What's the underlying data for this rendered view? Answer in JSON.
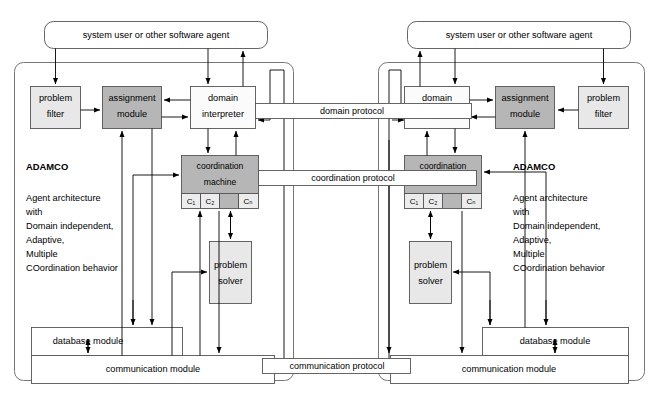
{
  "diagram": {
    "colors": {
      "white": "#ffffff",
      "light_gray": "#e8e8e8",
      "mid_gray": "#d9d9d9",
      "dark_gray": "#b6b6b6",
      "line": "#000000",
      "box_border": "#555555",
      "outer_border": "#777777"
    },
    "external_actors": [
      {
        "id": "actor-left",
        "label": "system user or other software agent"
      },
      {
        "id": "actor-right",
        "label": "system user or other software agent"
      }
    ],
    "protocols": [
      {
        "id": "domain-protocol",
        "label": "domain protocol"
      },
      {
        "id": "coordination-protocol",
        "label": "coordination protocol"
      },
      {
        "id": "communication-protocol",
        "label": "communication protocol"
      }
    ],
    "agents": [
      {
        "id": "agent-left",
        "side": "left",
        "acronym": "ADAMCO",
        "expansion": [
          "Agent architecture",
          "   with",
          "Domain independent,",
          "Adaptive,",
          "Multiple",
          "COordination behavior"
        ],
        "modules": [
          {
            "id": "problem-filter",
            "line1": "problem",
            "line2": "filter",
            "fill": "light_gray"
          },
          {
            "id": "assignment-module",
            "line1": "assignment",
            "line2": "module",
            "fill": "dark_gray"
          },
          {
            "id": "domain-interpreter",
            "line1": "domain",
            "line2": "interpreter",
            "fill": "white"
          },
          {
            "id": "coordination-machine",
            "line1": "coordination",
            "line2": "machine",
            "fill": "dark_gray"
          },
          {
            "id": "problem-solver",
            "line1": "problem",
            "line2": "solver",
            "fill": "light_gray"
          },
          {
            "id": "database-module",
            "line1": "database module",
            "line2": "",
            "fill": "white"
          },
          {
            "id": "communication-module",
            "line1": "communication module",
            "line2": "",
            "fill": "white"
          }
        ],
        "coordination_cells": [
          "C₁",
          "C₂",
          "",
          "Cₙ"
        ]
      },
      {
        "id": "agent-right",
        "side": "right",
        "acronym": "ADAMCO",
        "expansion": [
          "Agent architecture",
          "   with",
          "Domain independent,",
          "Adaptive,",
          "Multiple",
          "COordination behavior"
        ],
        "modules": [
          {
            "id": "problem-filter",
            "line1": "problem",
            "line2": "filter",
            "fill": "light_gray"
          },
          {
            "id": "assignment-module",
            "line1": "assignment",
            "line2": "module",
            "fill": "dark_gray"
          },
          {
            "id": "domain-interpreter",
            "line1": "domain",
            "line2": "interpreter",
            "fill": "white"
          },
          {
            "id": "coordination-machine",
            "line1": "coordination",
            "line2": "machine",
            "fill": "dark_gray"
          },
          {
            "id": "problem-solver",
            "line1": "problem",
            "line2": "solver",
            "fill": "light_gray"
          },
          {
            "id": "database-module",
            "line1": "database module",
            "line2": "",
            "fill": "white"
          },
          {
            "id": "communication-module",
            "line1": "communication module",
            "line2": "",
            "fill": "white"
          }
        ],
        "coordination_cells": [
          "C₁",
          "C₂",
          "",
          "Cₙ"
        ]
      }
    ]
  }
}
